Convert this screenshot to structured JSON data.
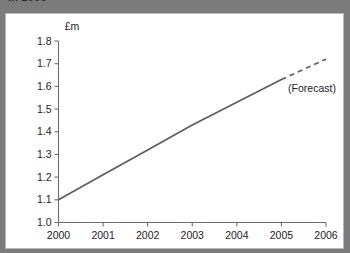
{
  "header": {
    "title_clipped": "in 2006"
  },
  "chart_data": {
    "type": "line",
    "title": "",
    "xlabel": "",
    "ylabel": "£m",
    "unit_label": "£m",
    "xlim": [
      2000,
      2006
    ],
    "ylim": [
      1.0,
      1.8
    ],
    "grid": false,
    "legend_position": "none",
    "x_ticks": [
      "2000",
      "2001",
      "2002",
      "2003",
      "2004",
      "2005",
      "2006"
    ],
    "y_ticks": [
      "1.0",
      "1.1",
      "1.2",
      "1.3",
      "1.4",
      "1.5",
      "1.6",
      "1.7",
      "1.8"
    ],
    "annotations": [
      {
        "text": "(Forecast)",
        "x": 2005.15,
        "y": 1.575
      }
    ],
    "series": [
      {
        "name": "Actual",
        "style": "solid",
        "color": "#5d5d5d",
        "x": [
          2000,
          2001,
          2002,
          2003,
          2004,
          2005
        ],
        "values": [
          1.1,
          1.21,
          1.32,
          1.43,
          1.53,
          1.63
        ]
      },
      {
        "name": "Forecast",
        "style": "dashed",
        "color": "#5d5d5d",
        "x": [
          2005,
          2006
        ],
        "values": [
          1.63,
          1.72
        ]
      }
    ]
  },
  "colors": {
    "header_bar": "#7b7b7b",
    "card_background": "#ffffff",
    "card_border": "#b8b8b8",
    "axis": "#6e6e6e",
    "line": "#5d5d5d",
    "text": "#1d1d1d"
  }
}
